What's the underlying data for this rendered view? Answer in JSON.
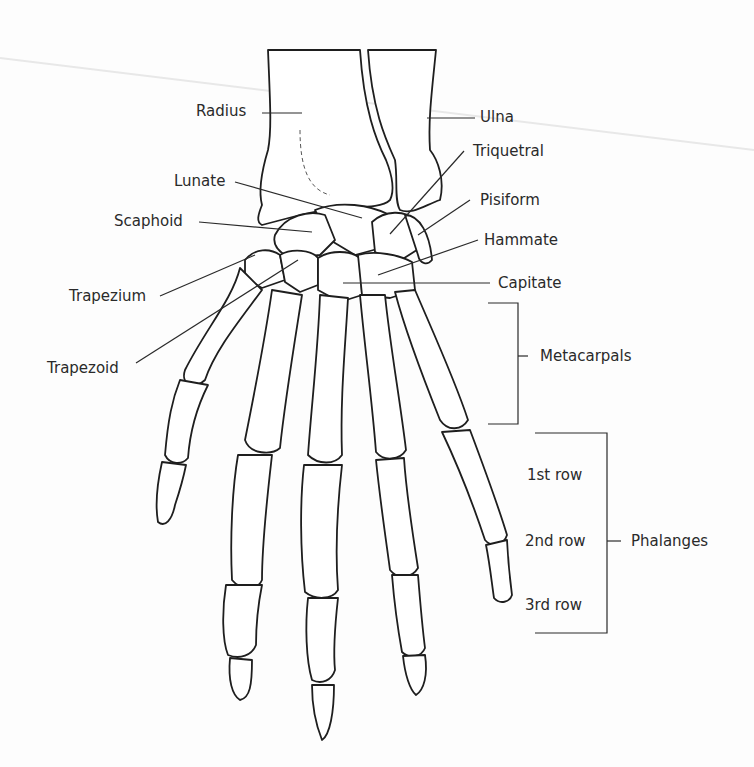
{
  "figure": {
    "labels": {
      "radius": "Radius",
      "ulna": "Ulna",
      "triquetral": "Triquetral",
      "lunate": "Lunate",
      "pisiform": "Pisiform",
      "scaphoid": "Scaphoid",
      "hammate": "Hammate",
      "capitate": "Capitate",
      "trapezium": "Trapezium",
      "trapezoid": "Trapezoid",
      "metacarpals": "Metacarpals",
      "phalanges": "Phalanges",
      "row1": "1st row",
      "row2": "2nd row",
      "row3": "3rd row"
    }
  }
}
